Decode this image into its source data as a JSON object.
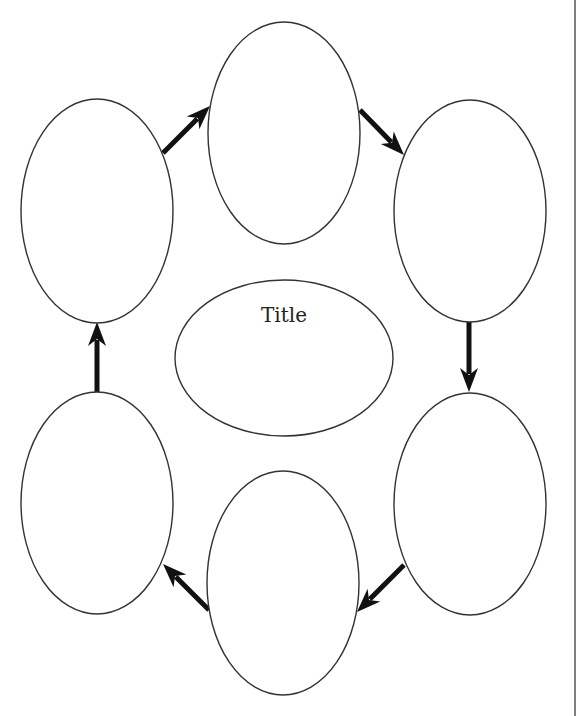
{
  "diagram": {
    "type": "cycle-graphic-organizer",
    "center": {
      "label": "Title",
      "cx": 284,
      "cy": 358,
      "rx": 109,
      "ry": 78,
      "label_y": 322
    },
    "nodes": [
      {
        "id": "top",
        "label": "",
        "cx": 284,
        "cy": 133,
        "rx": 76,
        "ry": 111
      },
      {
        "id": "top-right",
        "label": "",
        "cx": 470,
        "cy": 211,
        "rx": 76,
        "ry": 111
      },
      {
        "id": "bottom-right",
        "label": "",
        "cx": 470,
        "cy": 504,
        "rx": 76,
        "ry": 111
      },
      {
        "id": "bottom",
        "label": "",
        "cx": 283,
        "cy": 583,
        "rx": 76,
        "ry": 112
      },
      {
        "id": "bottom-left",
        "label": "",
        "cx": 97,
        "cy": 503,
        "rx": 76,
        "ry": 111
      },
      {
        "id": "top-left",
        "label": "",
        "cx": 97,
        "cy": 211,
        "rx": 76,
        "ry": 112
      }
    ],
    "arrows": [
      {
        "from": "top-left",
        "to": "top",
        "x1": 163,
        "y1": 153,
        "x2": 210,
        "y2": 106
      },
      {
        "from": "top",
        "to": "top-right",
        "x1": 360,
        "y1": 110,
        "x2": 404,
        "y2": 155
      },
      {
        "from": "top-right",
        "to": "bottom-right",
        "x1": 469,
        "y1": 322,
        "x2": 469,
        "y2": 392
      },
      {
        "from": "bottom-right",
        "to": "bottom",
        "x1": 404,
        "y1": 565,
        "x2": 357,
        "y2": 612
      },
      {
        "from": "bottom",
        "to": "bottom-left",
        "x1": 209,
        "y1": 610,
        "x2": 163,
        "y2": 564
      },
      {
        "from": "bottom-left",
        "to": "top-left",
        "x1": 97,
        "y1": 392,
        "x2": 97,
        "y2": 322
      }
    ],
    "right_rule_x": 575,
    "colors": {
      "stroke": "#333333",
      "arrow": "#111111",
      "background": "#ffffff",
      "rule": "#555555"
    }
  }
}
